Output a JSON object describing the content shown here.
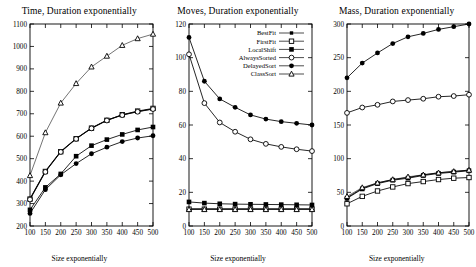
{
  "figure": {
    "xlabel": "Size exponentially",
    "legend_position": "top-right of middle panel",
    "series_names": [
      "BestFit",
      "FirstFit",
      "LocalShift",
      "AlwaysSorted",
      "DelayedSort",
      "ClassSort"
    ],
    "markers": [
      "filled-square-small",
      "open-square",
      "filled-square",
      "open-circle",
      "filled-circle",
      "open-triangle"
    ]
  },
  "legend": {
    "items": [
      {
        "label": "BestFit",
        "marker": "filled-square-small"
      },
      {
        "label": "FirstFit",
        "marker": "open-square"
      },
      {
        "label": "LocalShift",
        "marker": "filled-square"
      },
      {
        "label": "AlwaysSorted",
        "marker": "open-circle"
      },
      {
        "label": "DelayedSort",
        "marker": "filled-circle"
      },
      {
        "label": "ClassSort",
        "marker": "open-triangle"
      }
    ]
  },
  "chart_data": [
    {
      "type": "line",
      "title": "Time, Duration exponentially",
      "xlabel": "Size exponentially",
      "ylabel": "",
      "x": [
        100,
        150,
        200,
        250,
        300,
        350,
        400,
        450,
        500
      ],
      "xticks": [
        100,
        150,
        200,
        250,
        300,
        350,
        400,
        450,
        500
      ],
      "yticks": [
        200,
        300,
        400,
        500,
        600,
        700,
        800,
        900,
        1000,
        1100
      ],
      "xlim": [
        100,
        500
      ],
      "ylim": [
        200,
        1100
      ],
      "grid": false,
      "series": [
        {
          "name": "BestFit",
          "marker": "filled-square-small",
          "values": [
            322,
            445,
            533,
            590,
            637,
            672,
            695,
            710,
            722
          ]
        },
        {
          "name": "FirstFit",
          "marker": "open-square",
          "values": [
            320,
            443,
            531,
            589,
            636,
            671,
            696,
            712,
            724
          ]
        },
        {
          "name": "LocalShift",
          "marker": "filled-square",
          "values": [
            272,
            372,
            432,
            511,
            558,
            585,
            608,
            628,
            641
          ]
        },
        {
          "name": "AlwaysSorted",
          "marker": "open-circle",
          "values": [
            318,
            441,
            530,
            588,
            635,
            670,
            694,
            709,
            721
          ]
        },
        {
          "name": "DelayedSort",
          "marker": "filled-circle",
          "values": [
            256,
            362,
            428,
            478,
            522,
            551,
            576,
            592,
            602
          ]
        },
        {
          "name": "ClassSort",
          "marker": "open-triangle",
          "values": [
            425,
            616,
            748,
            835,
            909,
            957,
            1005,
            1035,
            1055
          ]
        }
      ]
    },
    {
      "type": "line",
      "title": "Moves, Duration exponentially",
      "xlabel": "Size exponentially",
      "ylabel": "",
      "x": [
        100,
        150,
        200,
        250,
        300,
        350,
        400,
        450,
        500
      ],
      "xticks": [
        100,
        150,
        200,
        250,
        300,
        350,
        400,
        450,
        500
      ],
      "yticks": [
        0,
        20,
        40,
        60,
        80,
        100,
        120
      ],
      "xlim": [
        100,
        500
      ],
      "ylim": [
        0,
        120
      ],
      "grid": false,
      "series": [
        {
          "name": "BestFit",
          "marker": "filled-square-small",
          "values": [
            10.2,
            10.2,
            10.2,
            10.2,
            10.2,
            10.2,
            10.2,
            10.2,
            10.2
          ]
        },
        {
          "name": "FirstFit",
          "marker": "open-square",
          "values": [
            10.0,
            10.0,
            10.0,
            10.0,
            10.0,
            10.0,
            10.0,
            10.0,
            10.0
          ]
        },
        {
          "name": "LocalShift",
          "marker": "filled-square",
          "values": [
            14.3,
            13.6,
            13.2,
            13.0,
            12.9,
            12.8,
            12.7,
            12.6,
            12.5
          ]
        },
        {
          "name": "AlwaysSorted",
          "marker": "open-circle",
          "values": [
            102,
            73,
            61.5,
            56,
            51.5,
            48.8,
            47.0,
            45.6,
            44.5
          ]
        },
        {
          "name": "DelayedSort",
          "marker": "filled-circle",
          "values": [
            112,
            86,
            75.5,
            70.5,
            66,
            63.5,
            62,
            61,
            60
          ]
        },
        {
          "name": "ClassSort",
          "marker": "open-triangle",
          "values": [
            9.8,
            9.8,
            9.8,
            9.8,
            9.8,
            9.8,
            9.8,
            9.8,
            9.8
          ]
        }
      ]
    },
    {
      "type": "line",
      "title": "Mass, Duration exponentially",
      "xlabel": "Size exponentially",
      "ylabel": "",
      "x": [
        100,
        150,
        200,
        250,
        300,
        350,
        400,
        450,
        500
      ],
      "xticks": [
        100,
        150,
        200,
        250,
        300,
        350,
        400,
        450,
        500
      ],
      "yticks": [
        0,
        50,
        100,
        150,
        200,
        250,
        300
      ],
      "xlim": [
        100,
        500
      ],
      "ylim": [
        0,
        300
      ],
      "grid": false,
      "series": [
        {
          "name": "BestFit",
          "marker": "filled-square-small",
          "values": [
            42,
            56,
            64,
            69,
            72,
            76,
            79,
            81,
            83
          ]
        },
        {
          "name": "FirstFit",
          "marker": "open-square",
          "values": [
            33,
            44,
            52,
            58,
            63,
            66,
            69,
            71,
            72
          ]
        },
        {
          "name": "LocalShift",
          "marker": "filled-square",
          "values": [
            41,
            55,
            63,
            68,
            71,
            75,
            78,
            80,
            82
          ]
        },
        {
          "name": "AlwaysSorted",
          "marker": "open-circle",
          "values": [
            168,
            176,
            180,
            185,
            187,
            189,
            192,
            193,
            195
          ]
        },
        {
          "name": "DelayedSort",
          "marker": "filled-circle",
          "values": [
            220,
            242,
            257,
            271,
            281,
            286,
            292,
            296,
            300
          ]
        },
        {
          "name": "ClassSort",
          "marker": "open-triangle",
          "values": [
            44,
            57,
            64,
            69,
            73,
            76,
            79,
            81,
            83
          ]
        }
      ]
    }
  ]
}
